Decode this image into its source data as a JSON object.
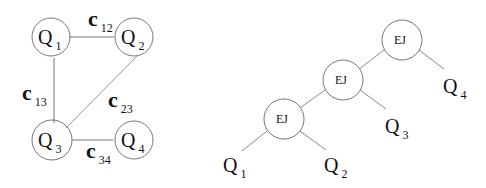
{
  "query_graph": {
    "nodes": [
      {
        "id": "Q1",
        "letter": "Q",
        "sub": "1"
      },
      {
        "id": "Q2",
        "letter": "Q",
        "sub": "2"
      },
      {
        "id": "Q3",
        "letter": "Q",
        "sub": "3"
      },
      {
        "id": "Q4",
        "letter": "Q",
        "sub": "4"
      }
    ],
    "edges": [
      {
        "from": "Q1",
        "to": "Q2",
        "letter": "c",
        "sub": "12"
      },
      {
        "from": "Q1",
        "to": "Q3",
        "letter": "c",
        "sub": "13"
      },
      {
        "from": "Q2",
        "to": "Q3",
        "letter": "c",
        "sub": "23"
      },
      {
        "from": "Q3",
        "to": "Q4",
        "letter": "c",
        "sub": "34"
      }
    ]
  },
  "join_tree": {
    "operators": [
      {
        "id": "top",
        "label": "EJ"
      },
      {
        "id": "middle",
        "label": "EJ"
      },
      {
        "id": "bottom",
        "label": "EJ"
      }
    ],
    "leaves": [
      {
        "id": "Q1",
        "letter": "Q",
        "sub": "1"
      },
      {
        "id": "Q2",
        "letter": "Q",
        "sub": "2"
      },
      {
        "id": "Q3",
        "letter": "Q",
        "sub": "3"
      },
      {
        "id": "Q4",
        "letter": "Q",
        "sub": "4"
      }
    ]
  },
  "colors": {
    "line": "#777777",
    "circle": "#777777",
    "text": "#111111"
  }
}
